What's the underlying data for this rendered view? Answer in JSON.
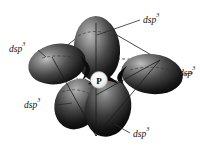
{
  "figure": {
    "background_color": "#ffffff",
    "central_atom": {
      "symbol": "P",
      "name": "phosphorus-atom"
    },
    "label_text": {
      "base": "dsp",
      "superscript": "3"
    },
    "labels": [
      {
        "id": "top",
        "base": "dsp",
        "sup": "3"
      },
      {
        "id": "upper-left",
        "base": "dsp",
        "sup": "3"
      },
      {
        "id": "right",
        "base": "dsp",
        "sup": "3"
      },
      {
        "id": "lower-left",
        "base": "dsp",
        "sup": "3"
      },
      {
        "id": "bottom",
        "base": "dsp",
        "sup": "3"
      }
    ],
    "colors": {
      "lobe_dark": "#101010",
      "lobe_mid": "#4a4a4a",
      "lobe_highlight": "#c9c9c9",
      "line": "#1a1a1a",
      "text": "#111111",
      "atom_fill": "#f2f2f0"
    }
  }
}
